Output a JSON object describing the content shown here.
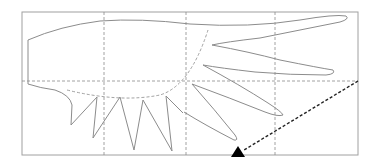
{
  "diagram": {
    "colors": {
      "frame": "#9a9a9a",
      "grid": "#8a8a8a",
      "outline": "#8c8c8c",
      "arrow": "#222222",
      "marker": "#000000"
    },
    "frame": {
      "x": 22,
      "y": 12,
      "w": 336,
      "h": 143
    },
    "grid": {
      "vertical_x": [
        104,
        275
      ],
      "horizontal_y": [
        81
      ],
      "middle_vertical_x": 186
    },
    "marker": {
      "type": "triangle",
      "x": 238,
      "y": 152
    },
    "arrow": {
      "from": [
        358,
        81
      ],
      "to": [
        244,
        150
      ]
    }
  }
}
